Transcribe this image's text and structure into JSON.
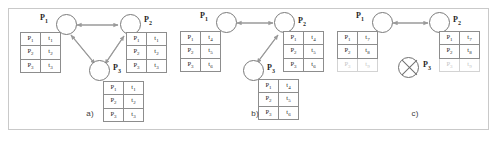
{
  "figure": {
    "caption_a": "a)",
    "caption_b": "b)",
    "caption_c": "c)",
    "colors": {
      "frame_border": "#c9c9c9",
      "node_stroke": "#7a7a7a",
      "arrow_stroke": "#9a9a9a",
      "table_border": "#8d8d8d",
      "text": "#1f1f1f",
      "faded_text": "#c4c4c4",
      "background": "#ffffff"
    }
  },
  "panels": [
    {
      "id": "a",
      "caption": "a)",
      "nodes": [
        {
          "name": "P1",
          "label": "P",
          "sub": "1",
          "state": "alive",
          "label_side": "left"
        },
        {
          "name": "P2",
          "label": "P",
          "sub": "2",
          "state": "alive",
          "label_side": "right"
        },
        {
          "name": "P3",
          "label": "P",
          "sub": "3",
          "state": "alive",
          "label_side": "right"
        }
      ],
      "edges": [
        {
          "from": "P1",
          "to": "P2",
          "bidirectional": true
        },
        {
          "from": "P1",
          "to": "P3",
          "bidirectional": true
        },
        {
          "from": "P2",
          "to": "P3",
          "bidirectional": true
        }
      ],
      "tables": [
        {
          "owner": "P1",
          "header": null,
          "rows": [
            {
              "process": "P",
              "process_sub": "1",
              "time": "t",
              "time_sub": "1",
              "faded": false
            },
            {
              "process": "P",
              "process_sub": "2",
              "time": "t",
              "time_sub": "2",
              "faded": false
            },
            {
              "process": "P",
              "process_sub": "3",
              "time": "t",
              "time_sub": "3",
              "faded": false
            }
          ]
        },
        {
          "owner": "P2",
          "header": null,
          "rows": [
            {
              "process": "P",
              "process_sub": "1",
              "time": "t",
              "time_sub": "1",
              "faded": false
            },
            {
              "process": "P",
              "process_sub": "2",
              "time": "t",
              "time_sub": "2",
              "faded": false
            },
            {
              "process": "P",
              "process_sub": "3",
              "time": "t",
              "time_sub": "3",
              "faded": false
            }
          ]
        },
        {
          "owner": "P3",
          "header": null,
          "rows": [
            {
              "process": "P",
              "process_sub": "1",
              "time": "t",
              "time_sub": "1",
              "faded": false
            },
            {
              "process": "P",
              "process_sub": "2",
              "time": "t",
              "time_sub": "2",
              "faded": false
            },
            {
              "process": "P",
              "process_sub": "3",
              "time": "t",
              "time_sub": "3",
              "faded": false
            }
          ]
        }
      ]
    },
    {
      "id": "b",
      "caption": "b)",
      "nodes": [
        {
          "name": "P1",
          "label": "P",
          "sub": "1",
          "state": "alive",
          "label_side": "left"
        },
        {
          "name": "P2",
          "label": "P",
          "sub": "2",
          "state": "alive",
          "label_side": "right"
        },
        {
          "name": "P3",
          "label": "P",
          "sub": "3",
          "state": "alive",
          "label_side": "right"
        }
      ],
      "edges": [
        {
          "from": "P1",
          "to": "P2",
          "bidirectional": true
        },
        {
          "from": "P2",
          "to": "P3",
          "bidirectional": true
        }
      ],
      "tables": [
        {
          "owner": "P1",
          "header": null,
          "rows": [
            {
              "process": "P",
              "process_sub": "1",
              "time": "t",
              "time_sub": "4",
              "faded": false
            },
            {
              "process": "P",
              "process_sub": "2",
              "time": "t",
              "time_sub": "5",
              "faded": false
            },
            {
              "process": "P",
              "process_sub": "3",
              "time": "t",
              "time_sub": "6",
              "faded": false
            }
          ]
        },
        {
          "owner": "P2",
          "header": null,
          "rows": [
            {
              "process": "P",
              "process_sub": "1",
              "time": "t",
              "time_sub": "4",
              "faded": false
            },
            {
              "process": "P",
              "process_sub": "2",
              "time": "t",
              "time_sub": "5",
              "faded": false
            },
            {
              "process": "P",
              "process_sub": "3",
              "time": "t",
              "time_sub": "6",
              "faded": false
            }
          ]
        },
        {
          "owner": "P3",
          "header": null,
          "rows": [
            {
              "process": "P",
              "process_sub": "1",
              "time": "t",
              "time_sub": "4",
              "faded": false
            },
            {
              "process": "P",
              "process_sub": "2",
              "time": "t",
              "time_sub": "5",
              "faded": false
            },
            {
              "process": "P",
              "process_sub": "3",
              "time": "t",
              "time_sub": "6",
              "faded": false
            }
          ]
        }
      ]
    },
    {
      "id": "c",
      "caption": "c)",
      "nodes": [
        {
          "name": "P1",
          "label": "P",
          "sub": "1",
          "state": "alive",
          "label_side": "left"
        },
        {
          "name": "P2",
          "label": "P",
          "sub": "2",
          "state": "alive",
          "label_side": "right"
        },
        {
          "name": "P3",
          "label": "P",
          "sub": "3",
          "state": "crossed-out",
          "label_side": "right"
        }
      ],
      "edges": [
        {
          "from": "P1",
          "to": "P2",
          "bidirectional": true
        }
      ],
      "tables": [
        {
          "owner": "P1",
          "header": null,
          "rows": [
            {
              "process": "P",
              "process_sub": "1",
              "time": "t",
              "time_sub": "7",
              "faded": false
            },
            {
              "process": "P",
              "process_sub": "2",
              "time": "t",
              "time_sub": "8",
              "faded": false
            },
            {
              "process": "P",
              "process_sub": "3",
              "time": "t",
              "time_sub": "9",
              "faded": true
            }
          ]
        },
        {
          "owner": "P2",
          "header": null,
          "rows": [
            {
              "process": "P",
              "process_sub": "1",
              "time": "t",
              "time_sub": "7",
              "faded": false
            },
            {
              "process": "P",
              "process_sub": "2",
              "time": "t",
              "time_sub": "8",
              "faded": false
            },
            {
              "process": "P",
              "process_sub": "3",
              "time": "t",
              "time_sub": "9",
              "faded": true
            }
          ]
        }
      ]
    }
  ]
}
